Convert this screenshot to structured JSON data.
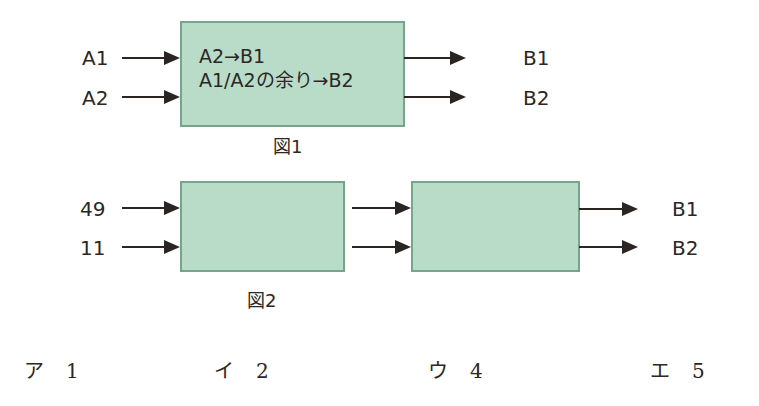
{
  "figure1": {
    "caption": "図1",
    "inputs": [
      "A1",
      "A2"
    ],
    "outputs": [
      "B1",
      "B2"
    ],
    "box_lines": [
      "A2→B1",
      "A1/A2の余り→B2"
    ]
  },
  "figure2": {
    "caption": "図2",
    "inputs": [
      "49",
      "11"
    ],
    "outputs": [
      "B1",
      "B2"
    ]
  },
  "choices": [
    {
      "mark": "ア",
      "value": "1"
    },
    {
      "mark": "イ",
      "value": "2"
    },
    {
      "mark": "ウ",
      "value": "4"
    },
    {
      "mark": "エ",
      "value": "5"
    }
  ],
  "colors": {
    "box_fill": "#b9dcc9",
    "box_border": "#76a58a",
    "ink": "#2a2522"
  }
}
